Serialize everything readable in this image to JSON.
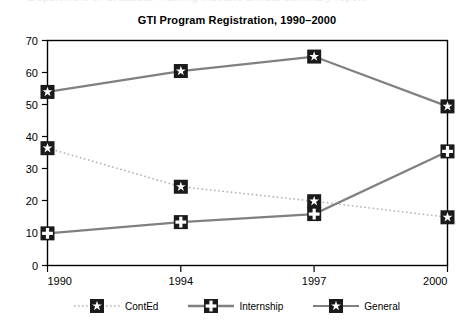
{
  "top_sliver": {
    "text": "Department of Graduate Training Institute annual summary report"
  },
  "chart_data": {
    "type": "line",
    "title": "GTI Program Registration, 1990–2000",
    "xlabel": "",
    "ylabel": "",
    "categories": [
      "1990",
      "1994",
      "1997",
      "2000"
    ],
    "x_tick_labels": [
      "1990",
      "1994",
      "1997",
      "2000"
    ],
    "y_tick_labels": [
      "0",
      "10",
      "20",
      "30",
      "40",
      "50",
      "60",
      "70"
    ],
    "y_ticks": [
      0,
      10,
      20,
      30,
      40,
      50,
      60,
      70
    ],
    "ylim": [
      0,
      70
    ],
    "grid": false,
    "legend_position": "bottom",
    "series": [
      {
        "name": "ContEd",
        "values": [
          36.5,
          24.5,
          20,
          15
        ],
        "line_style": "dotted",
        "line_color": "#b4b4b4",
        "marker": "star",
        "marker_color": "#1a1a1a"
      },
      {
        "name": "Internship",
        "values": [
          10,
          13.5,
          16,
          35.5
        ],
        "line_style": "solid",
        "line_color": "#808080",
        "marker": "plus",
        "marker_color": "#1a1a1a"
      },
      {
        "name": "General",
        "values": [
          54,
          60.5,
          65,
          49.5
        ],
        "line_style": "solid",
        "line_color": "#808080",
        "marker": "star",
        "marker_color": "#1a1a1a"
      }
    ]
  },
  "legend": {
    "items": [
      {
        "label": "ContEd"
      },
      {
        "label": "Internship"
      },
      {
        "label": "General"
      }
    ]
  },
  "colors": {
    "axis": "#000000",
    "line_gray": "#808080",
    "line_light": "#b4b4b4",
    "marker_fill": "#1a1a1a",
    "marker_glyph": "#ffffff",
    "background": "#ffffff"
  }
}
